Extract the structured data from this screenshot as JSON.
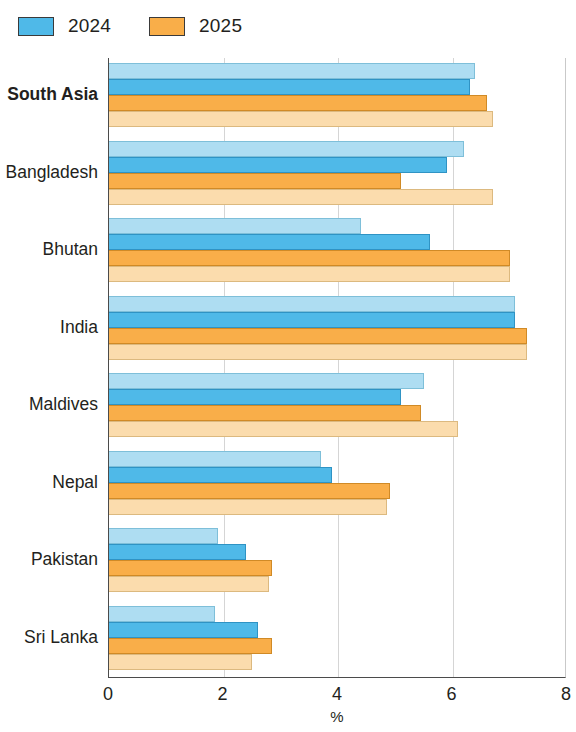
{
  "legend": {
    "position": "top-left",
    "items": [
      {
        "label": "2024",
        "color": "#4fb9e8",
        "name": "legend-2024"
      },
      {
        "label": "2025",
        "color": "#f9ae49",
        "name": "legend-2025"
      }
    ]
  },
  "axis": {
    "x_title": "%",
    "x_ticks": [
      "0",
      "2",
      "4",
      "6",
      "8"
    ],
    "x_min": 0,
    "x_max": 8
  },
  "chart_data": {
    "type": "bar",
    "orientation": "horizontal",
    "title": "",
    "subtitle": "",
    "xlabel": "%",
    "ylabel": "",
    "xlim": [
      0,
      8
    ],
    "xticks": [
      0,
      2,
      4,
      6,
      8
    ],
    "grid": true,
    "legend_position": "top-left",
    "categories": [
      "South Asia",
      "Bangladesh",
      "Bhutan",
      "India",
      "Maldives",
      "Nepal",
      "Pakistan",
      "Sri Lanka"
    ],
    "bold_categories": [
      "South Asia"
    ],
    "series": [
      {
        "name": "2024 (upper)",
        "legend": "2024",
        "color": "#aeddf2",
        "values": [
          6.4,
          6.2,
          4.4,
          7.1,
          5.5,
          3.7,
          1.9,
          1.85
        ]
      },
      {
        "name": "2024",
        "legend": "2024",
        "color": "#4fb9e8",
        "values": [
          6.3,
          5.9,
          5.6,
          7.1,
          5.1,
          3.9,
          2.4,
          2.6
        ]
      },
      {
        "name": "2025",
        "legend": "2025",
        "color": "#f9ae49",
        "values": [
          6.6,
          5.1,
          7.0,
          7.3,
          5.45,
          4.9,
          2.85,
          2.85
        ]
      },
      {
        "name": "2025 (upper)",
        "legend": "2025",
        "color": "#fbdcad",
        "values": [
          6.7,
          6.7,
          7.0,
          7.3,
          6.1,
          4.85,
          2.8,
          2.5
        ]
      }
    ]
  }
}
